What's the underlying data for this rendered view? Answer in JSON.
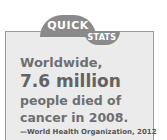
{
  "callout": {
    "tab_top": "QUICK",
    "tab_bottom": "STATS",
    "lines": [
      "Worldwide,",
      "7.6 million",
      "people died of",
      "cancer in 2008."
    ],
    "source": "—World Health Organization, 2012"
  },
  "colors": {
    "tab": "#8a8a8a",
    "box_bg": "#ebebeb",
    "text": "#6f6f6f"
  }
}
